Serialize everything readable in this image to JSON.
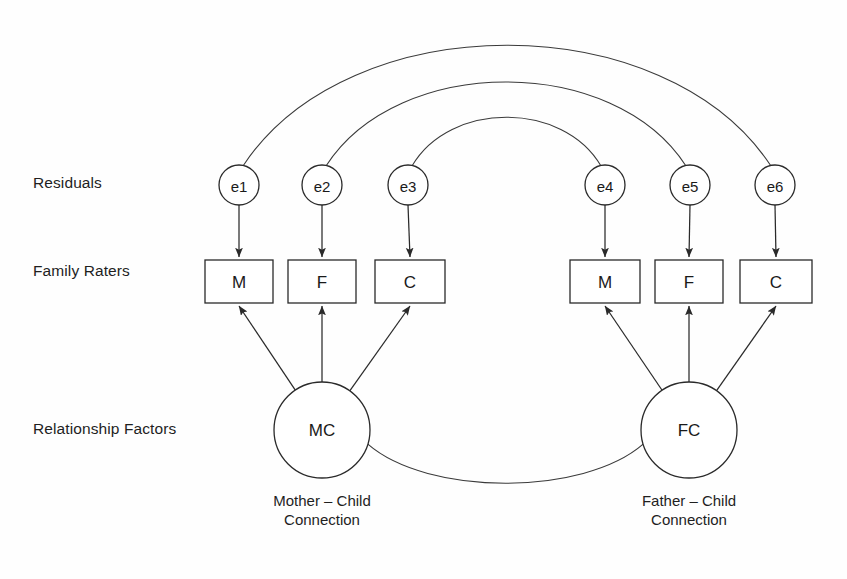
{
  "diagram": {
    "background_color": "#fefefe",
    "line_color": "#2a2a2a",
    "row_labels": [
      {
        "id": "residuals",
        "text": "Residuals"
      },
      {
        "id": "family-raters",
        "text": "Family Raters"
      },
      {
        "id": "relationship-factors",
        "text": "Relationship Factors"
      }
    ],
    "residuals": [
      {
        "id": "e1",
        "label": "e1",
        "cx": 239,
        "cy": 185,
        "r": 20
      },
      {
        "id": "e2",
        "label": "e2",
        "cx": 322,
        "cy": 185,
        "r": 20
      },
      {
        "id": "e3",
        "label": "e3",
        "cx": 408,
        "cy": 185,
        "r": 20
      },
      {
        "id": "e4",
        "label": "e4",
        "cx": 605,
        "cy": 185,
        "r": 20
      },
      {
        "id": "e5",
        "label": "e5",
        "cx": 690,
        "cy": 185,
        "r": 20
      },
      {
        "id": "e6",
        "label": "e6",
        "cx": 775,
        "cy": 185,
        "r": 20
      }
    ],
    "indicators": [
      {
        "id": "mc-mother",
        "label": "M",
        "x": 205,
        "y": 260,
        "w": 68,
        "h": 43
      },
      {
        "id": "mc-father",
        "label": "F",
        "x": 288,
        "y": 260,
        "w": 68,
        "h": 43
      },
      {
        "id": "mc-child",
        "label": "C",
        "x": 375,
        "y": 260,
        "w": 70,
        "h": 43
      },
      {
        "id": "fc-mother",
        "label": "M",
        "x": 570,
        "y": 260,
        "w": 70,
        "h": 43
      },
      {
        "id": "fc-father",
        "label": "F",
        "x": 655,
        "y": 260,
        "w": 68,
        "h": 43
      },
      {
        "id": "fc-child",
        "label": "C",
        "x": 740,
        "y": 260,
        "w": 72,
        "h": 43
      }
    ],
    "factors": [
      {
        "id": "mc",
        "label": "MC",
        "cx": 322,
        "cy": 430,
        "r": 48,
        "caption_line1": "Mother – Child",
        "caption_line2": "Connection"
      },
      {
        "id": "fc",
        "label": "FC",
        "cx": 689,
        "cy": 430,
        "r": 48,
        "caption_line1": "Father – Child",
        "caption_line2": "Connection"
      }
    ],
    "correlation_arcs": [
      {
        "id": "e1-e6",
        "from": "e1",
        "to": "e6",
        "apex_y": 31
      },
      {
        "id": "e2-e5",
        "from": "e2",
        "to": "e5",
        "apex_y": 80
      },
      {
        "id": "e3-e4",
        "from": "e3",
        "to": "e4",
        "apex_y": 127
      }
    ],
    "factor_covariance": {
      "id": "mc-fc",
      "from": "mc",
      "to": "fc",
      "style": "curved-line-no-arrowheads"
    }
  }
}
